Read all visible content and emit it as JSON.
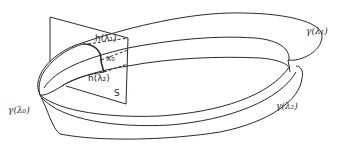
{
  "figure": {
    "type": "diagram",
    "labels": {
      "h1": "h(λ₁)",
      "x0": "x₀",
      "h2": "h(λ₂)",
      "section": "S",
      "gamma0": "γ(λ₀)",
      "gamma1": "γ(λ₁)",
      "gamma2": "γ(λ₂)"
    },
    "colors": {
      "line": "#2a2a2a",
      "background": "#ffffff"
    }
  }
}
